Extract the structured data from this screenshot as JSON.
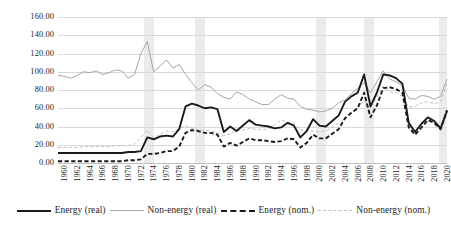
{
  "chart_data": {
    "type": "line",
    "title": "",
    "xlabel": "",
    "ylabel": "",
    "ylim": [
      0,
      160
    ],
    "ytick_step": 20,
    "grid": true,
    "legend_position": "bottom",
    "ytick_labels": [
      "160.00",
      "140.00",
      "120.00",
      "100.00",
      "80.00",
      "60.00",
      "40.00",
      "20.00",
      "0.00"
    ],
    "ytick_values": [
      160,
      140,
      120,
      100,
      80,
      60,
      40,
      20,
      0
    ],
    "xtick_labels": [
      "1960",
      "1962",
      "1964",
      "1966",
      "1968",
      "1970",
      "1972",
      "1974",
      "1976",
      "1978",
      "1980",
      "1982",
      "1984",
      "1986",
      "1988",
      "1990",
      "1992",
      "1994",
      "1996",
      "1998",
      "2000",
      "2002",
      "2004",
      "2006",
      "2008",
      "2010",
      "2012",
      "2014",
      "2016",
      "2018",
      "2020"
    ],
    "x": [
      1960,
      1961,
      1962,
      1963,
      1964,
      1965,
      1966,
      1967,
      1968,
      1969,
      1970,
      1971,
      1972,
      1973,
      1974,
      1975,
      1976,
      1977,
      1978,
      1979,
      1980,
      1981,
      1982,
      1983,
      1984,
      1985,
      1986,
      1987,
      1988,
      1989,
      1990,
      1991,
      1992,
      1993,
      1994,
      1995,
      1996,
      1997,
      1998,
      1999,
      2000,
      2001,
      2002,
      2003,
      2004,
      2005,
      2006,
      2007,
      2008,
      2009,
      2010,
      2011,
      2012,
      2013,
      2014,
      2015,
      2016,
      2017,
      2018,
      2019,
      2020,
      2021
    ],
    "xlim": [
      1960,
      2021
    ],
    "shaded_bands": [
      {
        "start": 1973.5,
        "end": 1975.0
      },
      {
        "start": 1981.5,
        "end": 1983.0
      },
      {
        "start": 2000.5,
        "end": 2002.0
      },
      {
        "start": 2008.0,
        "end": 2009.5
      },
      {
        "start": 2019.8,
        "end": 2021.0
      }
    ],
    "series": [
      {
        "name": "Energy (real)",
        "style": "solid",
        "width": "thick",
        "color": "#1a1a1a",
        "values": [
          11,
          11,
          11,
          11,
          11,
          11,
          11,
          11,
          11,
          11,
          11,
          12,
          12,
          13,
          28,
          26,
          29,
          30,
          29,
          37,
          62,
          65,
          63,
          60,
          61,
          59,
          34,
          40,
          35,
          41,
          47,
          42,
          41,
          40,
          38,
          39,
          44,
          41,
          28,
          35,
          48,
          41,
          40,
          46,
          52,
          67,
          73,
          77,
          97,
          62,
          77,
          97,
          96,
          93,
          87,
          44,
          34,
          43,
          50,
          46,
          38,
          57
        ],
        "annotations": {
          "notes": "Real energy price index; peaks ~1980-81 at ~65 and 2008 ~97, 2011-12 ~97"
        }
      },
      {
        "name": "Non-energy (real)",
        "style": "solid",
        "width": "thin",
        "color": "#a6a6a6",
        "values": [
          96,
          95,
          93,
          96,
          100,
          99,
          101,
          97,
          99,
          102,
          101,
          93,
          97,
          120,
          133,
          100,
          106,
          113,
          104,
          108,
          97,
          88,
          80,
          86,
          83,
          76,
          72,
          70,
          78,
          75,
          70,
          67,
          64,
          64,
          70,
          75,
          71,
          70,
          62,
          59,
          58,
          56,
          57,
          60,
          66,
          69,
          76,
          82,
          88,
          77,
          89,
          101,
          92,
          89,
          85,
          71,
          70,
          74,
          73,
          70,
          73,
          92
        ],
        "annotations": {
          "notes": "Real non-energy index; 1974 spike ~133, long decline after 1980"
        }
      },
      {
        "name": "Energy (nom.)",
        "style": "dashed",
        "width": "thick",
        "color": "#1a1a1a",
        "values": [
          2,
          2,
          2,
          2,
          2,
          2,
          2,
          2,
          2,
          2,
          2,
          3,
          3,
          4,
          10,
          10,
          11,
          13,
          13,
          18,
          33,
          36,
          35,
          33,
          33,
          31,
          18,
          22,
          19,
          23,
          27,
          25,
          25,
          24,
          23,
          24,
          27,
          26,
          17,
          22,
          31,
          27,
          27,
          32,
          37,
          49,
          55,
          60,
          77,
          50,
          63,
          82,
          83,
          81,
          77,
          39,
          31,
          39,
          47,
          44,
          37,
          58
        ],
        "annotations": {
          "notes": "Nominal energy index; peak ~83 in 2012, 2008 ~77"
        }
      },
      {
        "name": "Non-energy (nom.)",
        "style": "dashed",
        "width": "thin",
        "color": "#bfbfbf",
        "values": [
          17,
          17,
          17,
          17,
          18,
          18,
          18,
          18,
          18,
          19,
          19,
          19,
          21,
          28,
          36,
          28,
          31,
          35,
          34,
          38,
          41,
          38,
          36,
          36,
          35,
          33,
          30,
          32,
          36,
          36,
          38,
          37,
          37,
          37,
          42,
          47,
          45,
          44,
          36,
          35,
          35,
          34,
          35,
          39,
          44,
          48,
          54,
          61,
          68,
          60,
          72,
          84,
          78,
          77,
          73,
          61,
          62,
          66,
          67,
          65,
          67,
          87
        ],
        "annotations": {
          "notes": "Nominal non-energy index; rises steadily after 2000, 2021 ~87"
        }
      }
    ]
  },
  "legend": {
    "items": [
      {
        "label": "Energy (real)",
        "swatch": "solid-thick"
      },
      {
        "label": "Non-energy (real)",
        "swatch": "solid-thin"
      },
      {
        "label": "Energy (nom.)",
        "swatch": "dash-thick"
      },
      {
        "label": "Non-energy (nom.)",
        "swatch": "dash-thin"
      }
    ]
  },
  "colors": {
    "energy_real": "#1a1a1a",
    "non_energy_real": "#a6a6a6",
    "energy_nom": "#1a1a1a",
    "non_energy_nom": "#bfbfbf",
    "gridline": "#d9d9d9",
    "band": "#ebebeb",
    "background": "#ffffff"
  }
}
